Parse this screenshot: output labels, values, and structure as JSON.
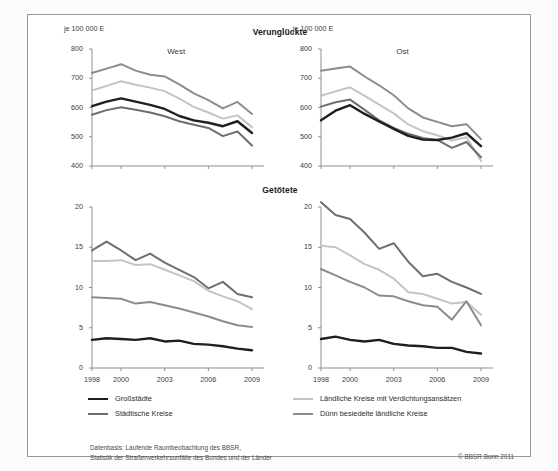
{
  "panel": {
    "section_titles": {
      "top": "Verunglückte",
      "bottom": "Getötete"
    },
    "unit_label": "je 100 000 E",
    "region_west": "West",
    "region_ost": "Ost"
  },
  "legend": {
    "items": [
      {
        "label": "Großstädte",
        "color": "#1f1f1f",
        "width": 2.6
      },
      {
        "label": "Städtische Kreise",
        "color": "#6e6e6e",
        "width": 2.2
      },
      {
        "label": "Ländliche Kreise mit Verdichtungsansätzen",
        "color": "#c4c4c4",
        "width": 2.2
      },
      {
        "label": "Dünn besiedelte ländliche Kreise",
        "color": "#8c8c8c",
        "width": 2.2
      }
    ]
  },
  "footer": {
    "source_line1": "Datenbasis: Laufende Raumbeobachtung des BBSR,",
    "source_line2": "Statistik der Straßenverkehrsunfälle des Bundes und der Länder",
    "copyright": "© BBSR Bonn 2011"
  },
  "chart_data": [
    {
      "id": "verungluckte-west",
      "type": "line",
      "title": "Verunglückte",
      "subtitle": "West",
      "ylabel": "je 100 000 E",
      "xlabel": "",
      "x": [
        1998,
        1999,
        2000,
        2001,
        2002,
        2003,
        2004,
        2005,
        2006,
        2007,
        2008,
        2009
      ],
      "xticks": [
        1998,
        2000,
        2003,
        2006,
        2009
      ],
      "yticks": [
        400,
        500,
        600,
        700,
        800
      ],
      "ylim": [
        400,
        800
      ],
      "grid": false,
      "legend_position": "below-figure",
      "series": [
        {
          "name": "Großstädte",
          "color": "#1f1f1f",
          "values": [
            605,
            620,
            631,
            620,
            609,
            595,
            571,
            556,
            548,
            536,
            553,
            513
          ]
        },
        {
          "name": "Städtische Kreise",
          "color": "#6e6e6e",
          "values": [
            575,
            591,
            601,
            592,
            583,
            570,
            553,
            541,
            530,
            502,
            518,
            470
          ]
        },
        {
          "name": "Ländliche Kreise mit Verdichtungsansätzen",
          "color": "#c4c4c4",
          "values": [
            658,
            674,
            690,
            678,
            668,
            656,
            630,
            602,
            583,
            562,
            573,
            533
          ]
        },
        {
          "name": "Dünn besiedelte ländliche Kreise",
          "color": "#8c8c8c",
          "values": [
            718,
            733,
            748,
            726,
            712,
            706,
            679,
            648,
            625,
            597,
            619,
            578
          ]
        }
      ]
    },
    {
      "id": "verungluckte-ost",
      "type": "line",
      "title": "Verunglückte",
      "subtitle": "Ost",
      "ylabel": "je 100 000 E",
      "xlabel": "",
      "x": [
        1998,
        1999,
        2000,
        2001,
        2002,
        2003,
        2004,
        2005,
        2006,
        2007,
        2008,
        2009
      ],
      "xticks": [
        1998,
        2000,
        2003,
        2006,
        2009
      ],
      "yticks": [
        400,
        500,
        600,
        700,
        800
      ],
      "ylim": [
        400,
        800
      ],
      "grid": false,
      "legend_position": "below-figure",
      "series": [
        {
          "name": "Großstädte",
          "color": "#1f1f1f",
          "values": [
            556,
            589,
            608,
            578,
            552,
            527,
            503,
            490,
            489,
            497,
            512,
            468
          ]
        },
        {
          "name": "Städtische Kreise",
          "color": "#6e6e6e",
          "values": [
            603,
            618,
            627,
            592,
            556,
            530,
            510,
            496,
            489,
            462,
            482,
            430
          ]
        },
        {
          "name": "Ländliche Kreise mit Verdichtungsansätzen",
          "color": "#c4c4c4",
          "values": [
            640,
            655,
            669,
            640,
            610,
            580,
            542,
            519,
            505,
            487,
            498,
            417
          ]
        },
        {
          "name": "Dünn besiedelte ländliche Kreise",
          "color": "#8c8c8c",
          "values": [
            726,
            733,
            740,
            706,
            676,
            642,
            597,
            566,
            551,
            536,
            543,
            492
          ]
        }
      ]
    },
    {
      "id": "getotete-west",
      "type": "line",
      "title": "Getötete",
      "subtitle": "West",
      "ylabel": "je 100 000 E",
      "xlabel": "",
      "x": [
        1998,
        1999,
        2000,
        2001,
        2002,
        2003,
        2004,
        2005,
        2006,
        2007,
        2008,
        2009
      ],
      "xticks": [
        1998,
        2000,
        2003,
        2006,
        2009
      ],
      "yticks": [
        0,
        5,
        10,
        15,
        20
      ],
      "ylim": [
        0,
        20
      ],
      "grid": false,
      "legend_position": "below-figure",
      "series": [
        {
          "name": "Großstädte",
          "color": "#1f1f1f",
          "values": [
            3.5,
            3.7,
            3.6,
            3.5,
            3.7,
            3.3,
            3.4,
            3.0,
            2.9,
            2.7,
            2.4,
            2.2
          ]
        },
        {
          "name": "Städtische Kreise",
          "color": "#8c8c8c",
          "values": [
            8.8,
            8.7,
            8.6,
            8.0,
            8.2,
            7.8,
            7.4,
            6.9,
            6.4,
            5.8,
            5.3,
            5.1
          ]
        },
        {
          "name": "Ländliche Kreise mit Verdichtungsansätzen",
          "color": "#c4c4c4",
          "values": [
            13.3,
            13.3,
            13.4,
            12.8,
            12.9,
            12.2,
            11.5,
            10.8,
            9.6,
            8.9,
            8.3,
            7.3
          ]
        },
        {
          "name": "Dünn besiedelte ländliche Kreise",
          "color": "#6e6e6e",
          "values": [
            14.6,
            15.7,
            14.6,
            13.4,
            14.2,
            13.1,
            12.2,
            11.3,
            9.9,
            10.7,
            9.2,
            8.8
          ]
        }
      ]
    },
    {
      "id": "getotete-ost",
      "type": "line",
      "title": "Getötete",
      "subtitle": "Ost",
      "ylabel": "je 100 000 E",
      "xlabel": "",
      "x": [
        1998,
        1999,
        2000,
        2001,
        2002,
        2003,
        2004,
        2005,
        2006,
        2007,
        2008,
        2009
      ],
      "xticks": [
        1998,
        2000,
        2003,
        2006,
        2009
      ],
      "yticks": [
        0,
        5,
        10,
        15,
        20
      ],
      "ylim": [
        0,
        20
      ],
      "grid": false,
      "legend_position": "below-figure",
      "series": [
        {
          "name": "Großstädte",
          "color": "#1f1f1f",
          "values": [
            3.6,
            3.9,
            3.5,
            3.3,
            3.5,
            3.0,
            2.8,
            2.7,
            2.5,
            2.5,
            2.0,
            1.8
          ]
        },
        {
          "name": "Städtische Kreise",
          "color": "#8c8c8c",
          "values": [
            12.3,
            11.5,
            10.7,
            10.0,
            9.0,
            8.9,
            8.3,
            7.8,
            7.6,
            6.0,
            8.3,
            5.3
          ]
        },
        {
          "name": "Ländliche Kreise mit Verdichtungsansätzen",
          "color": "#c4c4c4",
          "values": [
            15.2,
            15.0,
            14.0,
            12.9,
            12.2,
            11.1,
            9.4,
            9.2,
            8.6,
            8.0,
            8.2,
            6.6
          ]
        },
        {
          "name": "Dünn besiedelte ländliche Kreise",
          "color": "#6e6e6e",
          "values": [
            20.6,
            19.0,
            18.5,
            16.8,
            14.8,
            15.5,
            13.2,
            11.4,
            11.7,
            10.7,
            10.0,
            9.2
          ]
        }
      ]
    }
  ]
}
